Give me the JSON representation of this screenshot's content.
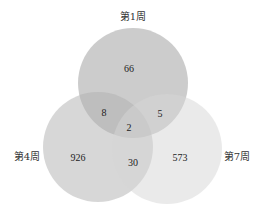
{
  "diagram": {
    "type": "venn-3",
    "sets": [
      {
        "id": "w1",
        "label": "第1周",
        "cx": 133,
        "cy": 83,
        "r": 55,
        "color": "#9a9a9a",
        "opacity": 0.5
      },
      {
        "id": "w4",
        "label": "第4周",
        "cx": 98,
        "cy": 147,
        "r": 55,
        "color": "#b0b0b0",
        "opacity": 0.5
      },
      {
        "id": "w7",
        "label": "第7周",
        "cx": 167,
        "cy": 149,
        "r": 55,
        "color": "#d6d6d6",
        "opacity": 0.5
      }
    ],
    "labels": {
      "w1": "第1周",
      "w4": "第4周",
      "w7": "第7周"
    },
    "regions": {
      "only_w1": "66",
      "only_w4": "926",
      "only_w7": "573",
      "w1_w4": "8",
      "w1_w7": "5",
      "w4_w7": "30",
      "w1_w4_w7": "2"
    }
  }
}
